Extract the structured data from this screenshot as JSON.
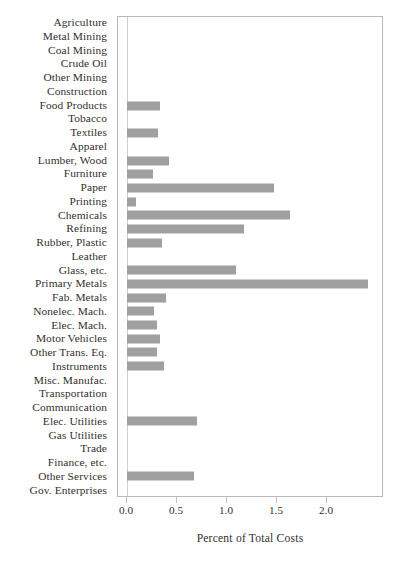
{
  "chart_data": {
    "type": "bar",
    "orientation": "horizontal",
    "title": "",
    "xlabel": "Percent of Total Costs",
    "ylabel": "",
    "xlim": [
      0.0,
      2.55
    ],
    "xticks": [
      0.0,
      0.5,
      1.0,
      1.5,
      2.0
    ],
    "xticklabels": [
      "0.0",
      "0.5",
      "1.0",
      "1.5",
      "2.0"
    ],
    "grid": false,
    "legend": null,
    "bar_color": "#a0a0a0",
    "categories": [
      "Agriculture",
      "Metal Mining",
      "Coal Mining",
      "Crude Oil",
      "Other Mining",
      "Construction",
      "Food Products",
      "Tobacco",
      "Textiles",
      "Apparel",
      "Lumber, Wood",
      "Furniture",
      "Paper",
      "Printing",
      "Chemicals",
      "Refining",
      "Rubber, Plastic",
      "Leather",
      "Glass, etc.",
      "Primary Metals",
      "Fab. Metals",
      "Nonelec. Mach.",
      "Elec. Mach.",
      "Motor Vehicles",
      "Other Trans. Eq.",
      "Instruments",
      "Misc. Manufac.",
      "Transportation",
      "Communication",
      "Elec. Utilities",
      "Gas Utilities",
      "Trade",
      "Finance, etc.",
      "Other Services",
      "Gov. Enterprises"
    ],
    "values": [
      0.0,
      0.0,
      0.0,
      0.0,
      0.0,
      0.0,
      0.33,
      0.0,
      0.31,
      0.0,
      0.42,
      0.26,
      1.47,
      0.09,
      1.63,
      1.17,
      0.35,
      0.0,
      1.09,
      2.41,
      0.39,
      0.27,
      0.3,
      0.33,
      0.3,
      0.37,
      0.0,
      0.0,
      0.0,
      0.7,
      0.0,
      0.0,
      0.0,
      0.67,
      0.0
    ]
  }
}
